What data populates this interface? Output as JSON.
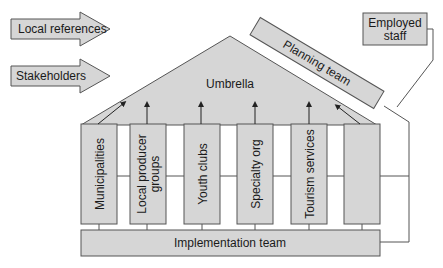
{
  "diagram": {
    "inputs": [
      {
        "label": "Local references"
      },
      {
        "label": "Stakeholders"
      }
    ],
    "umbrella": {
      "label": "Umbrella"
    },
    "planning_team": {
      "label": "Planning team"
    },
    "employed_staff": {
      "line1": "Employed",
      "line2": "staff"
    },
    "pillars": [
      {
        "line1": "Municipalities",
        "line2": ""
      },
      {
        "line1": "Local producer",
        "line2": "groups"
      },
      {
        "line1": "Youth clubs",
        "line2": ""
      },
      {
        "line1": "Specialty org",
        "line2": ""
      },
      {
        "line1": "Tourism services",
        "line2": ""
      },
      {
        "line1": "",
        "line2": ""
      }
    ],
    "implementation_team": {
      "label": "Implementation team"
    },
    "colors": {
      "fill": "#d6d6d6",
      "stroke": "#555555",
      "line": "#444444"
    }
  }
}
